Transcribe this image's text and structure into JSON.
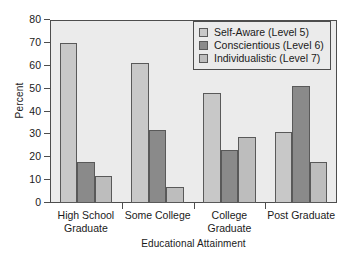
{
  "chart_data": {
    "type": "bar",
    "title": "",
    "xlabel": "Educational Attainment",
    "ylabel": "Percent",
    "ylim": [
      0,
      80
    ],
    "yticks": [
      0,
      10,
      20,
      30,
      40,
      50,
      60,
      70,
      80
    ],
    "grid": false,
    "legend_position": "top-right",
    "categories": [
      "High School\nGraduate",
      "Some College",
      "College\nGraduate",
      "Post Graduate"
    ],
    "series": [
      {
        "name": "Self-Aware (Level 5)",
        "color": "#c8c8c8",
        "values": [
          70,
          61,
          48,
          31
        ]
      },
      {
        "name": "Conscientious (Level 6)",
        "color": "#8a8a8a",
        "values": [
          18,
          32,
          23,
          51
        ]
      },
      {
        "name": "Individualistic (Level 7)",
        "color": "#bdbdbd",
        "values": [
          12,
          7,
          29,
          18
        ]
      }
    ]
  },
  "legend": {
    "items": [
      {
        "label": "Self-Aware (Level 5)"
      },
      {
        "label": "Conscientious (Level 6)"
      },
      {
        "label": "Individualistic (Level 7)"
      }
    ]
  },
  "axes": {
    "y_title": "Percent",
    "x_title": "Educational Attainment",
    "y_tick_labels": [
      "0",
      "10",
      "20",
      "30",
      "40",
      "50",
      "60",
      "70",
      "80"
    ],
    "x_tick_labels": [
      "High School\nGraduate",
      "Some College",
      "College\nGraduate",
      "Post Graduate"
    ]
  },
  "colors": {
    "plot_background": "#ebebeb",
    "page_background": "#ffffff",
    "axis": "#4d4d4d",
    "bar_border": "#595959",
    "series_1": "#c8c8c8",
    "series_2": "#8a8a8a",
    "series_3": "#bdbdbd"
  }
}
